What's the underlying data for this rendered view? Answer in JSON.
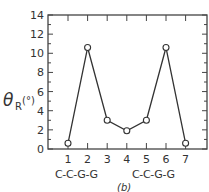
{
  "chart_data": {
    "type": "line",
    "title": "",
    "panel_label": "(b)",
    "ylabel": "θR(°)",
    "xlabel": "",
    "x": [
      1,
      2,
      3,
      4,
      5,
      6,
      7
    ],
    "x_sequence_labels": [
      "C-C-G-G",
      "C-C-G-G"
    ],
    "series": [
      {
        "name": "θR",
        "values": [
          0.6,
          10.6,
          3.0,
          1.9,
          3.0,
          10.6,
          0.6
        ]
      }
    ],
    "yticks": [
      0,
      2,
      4,
      6,
      8,
      10,
      12,
      14
    ],
    "xticks": [
      1,
      2,
      3,
      4,
      5,
      6,
      7
    ],
    "ylim": [
      0,
      14
    ],
    "xlim": [
      0.5,
      8.1
    ],
    "grid": false,
    "legend": "none",
    "colors": {
      "line": "#333333",
      "marker_fill": "#ffffff"
    }
  },
  "labels": {
    "ylabel_main": "θ",
    "ylabel_sub": "R",
    "ylabel_unit": "(°)",
    "seq_left": "C-C-G-G",
    "seq_right": "C-C-G-G",
    "panel": "(b)"
  }
}
